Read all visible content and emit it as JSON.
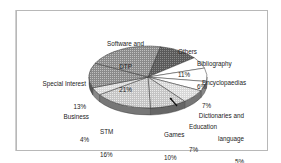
{
  "chart_data": {
    "type": "pie",
    "title": "",
    "style": "3d-exploded-tilt, grayscale hatch fills",
    "legend": "none (direct labels)",
    "slices": [
      {
        "name": "Others",
        "value": 11,
        "label": "Others",
        "pct": "11%",
        "fill": "#3a3a3a"
      },
      {
        "name": "Bibliography",
        "value": 6,
        "label": "Bibliography",
        "pct": "6%",
        "fill": "#ffffff"
      },
      {
        "name": "Encyclopaedias",
        "value": 7,
        "label": "Encyclopaedias",
        "pct": "7%",
        "fill": "#ffffff"
      },
      {
        "name": "Dictionaries and language",
        "value": 5,
        "label": "Dictionaries and\nlanguage",
        "pct": "5%",
        "fill": "#f4f4f4"
      },
      {
        "name": "Education",
        "value": 7,
        "label": "Education",
        "pct": "7%",
        "fill": "#dcdcdc"
      },
      {
        "name": "Games",
        "value": 10,
        "label": "Games",
        "pct": "10%",
        "fill": "#d2d2d2"
      },
      {
        "name": "STM",
        "value": 16,
        "label": "STM",
        "pct": "16%",
        "fill": "#c8c8c8"
      },
      {
        "name": "Business",
        "value": 4,
        "label": "Business",
        "pct": "4%",
        "fill": "#bdbdbd"
      },
      {
        "name": "Special Interest",
        "value": 13,
        "label": "Special Interest",
        "pct": "13%",
        "fill": "#8c8c8c"
      },
      {
        "name": "Software and DTP",
        "value": 21,
        "label": "Software and\nDTP",
        "pct": "21%",
        "fill": "#6e6e6e"
      }
    ],
    "total": 100
  },
  "labels": {
    "software": {
      "line1": "Software and",
      "line2": "DTP",
      "pct": "21%"
    },
    "others": {
      "line1": "Others",
      "pct": "11%"
    },
    "bibliography": {
      "line1": "Bibliography",
      "pct": "6%"
    },
    "encyclopaedias": {
      "line1": "Encyclopaedias",
      "pct": "7%"
    },
    "special": {
      "line1": "Special Interest",
      "pct": "13%"
    },
    "business": {
      "line1": "Business",
      "pct": "4%"
    },
    "stm": {
      "line1": "STM",
      "pct": "16%"
    },
    "games": {
      "line1": "Games",
      "pct": "10%"
    },
    "education": {
      "line1": "Education",
      "pct": "7%"
    },
    "dictionaries": {
      "line1": "Dictionaries and",
      "line2": "language",
      "pct": "5%"
    }
  }
}
